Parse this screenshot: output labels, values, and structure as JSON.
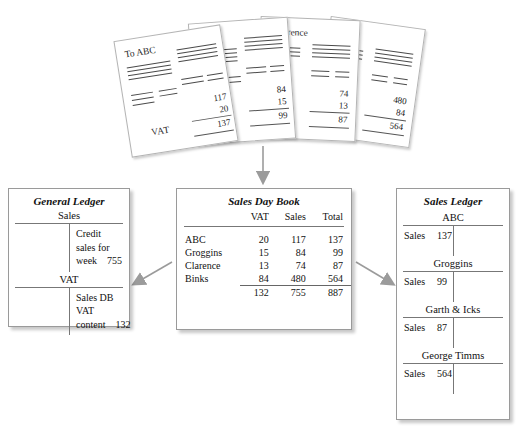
{
  "top_fragment": "",
  "invoices": [
    {
      "title": "To ABC",
      "vat_label": "VAT",
      "net": "117",
      "vat": "20",
      "total": "137"
    },
    {
      "title": "oggins",
      "vat_label": "",
      "net": "84",
      "vat": "15",
      "total": "99"
    },
    {
      "title": "o Clarence",
      "vat_label": "",
      "net": "74",
      "vat": "13",
      "total": "87"
    },
    {
      "title": "inks",
      "vat_label": "",
      "net": "480",
      "vat": "84",
      "total": "564"
    }
  ],
  "general_ledger": {
    "title": "General Ledger",
    "accounts": [
      {
        "name": "Sales",
        "left": [],
        "right": [
          {
            "label": "Credit"
          },
          {
            "label": "sales for"
          },
          {
            "label": "week",
            "amount": "755"
          }
        ]
      },
      {
        "name": "VAT",
        "left": [],
        "right": [
          {
            "label": "Sales DB"
          },
          {
            "label": "VAT"
          },
          {
            "label": "content",
            "amount": "132"
          }
        ]
      }
    ]
  },
  "sales_day_book": {
    "title": "Sales Day Book",
    "columns": [
      "",
      "VAT",
      "Sales",
      "Total"
    ],
    "rows": [
      {
        "name": "ABC",
        "vat": "20",
        "sales": "117",
        "total": "137"
      },
      {
        "name": "Groggins",
        "vat": "15",
        "sales": "84",
        "total": "99"
      },
      {
        "name": "Clarence",
        "vat": "13",
        "sales": "74",
        "total": "87"
      },
      {
        "name": "Binks",
        "vat": "84",
        "sales": "480",
        "total": "564"
      }
    ],
    "totals": {
      "name": "",
      "vat": "132",
      "sales": "755",
      "total": "887"
    }
  },
  "sales_ledger": {
    "title": "Sales Ledger",
    "accounts": [
      {
        "name": "ABC",
        "entry_label": "Sales",
        "amount": "137"
      },
      {
        "name": "Groggins",
        "entry_label": "Sales",
        "amount": "99"
      },
      {
        "name": "Garth & Icks",
        "entry_label": "Sales",
        "amount": "87"
      },
      {
        "name": "George Timms",
        "entry_label": "Sales",
        "amount": "564"
      }
    ]
  },
  "colors": {
    "arrow": "#9b9b9b",
    "panel_border": "#9a9a9a",
    "rule": "#777777"
  }
}
